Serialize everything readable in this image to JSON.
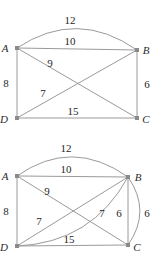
{
  "document": {
    "title": "Weighted quadrilateral graph diagrams",
    "background_color": "#ffffff",
    "edge_color": "#9a9a9a",
    "label_color": "#1f1f1f",
    "vertex_color": "#8a8a8a"
  },
  "figures": [
    {
      "id": "figure-top",
      "vertices": [
        {
          "name": "A",
          "label": "A",
          "x": 17,
          "y": 48,
          "label_x": 5,
          "label_y": 52
        },
        {
          "name": "B",
          "label": "B",
          "x": 137,
          "y": 50,
          "label_x": 146,
          "label_y": 54
        },
        {
          "name": "C",
          "label": "C",
          "x": 137,
          "y": 118,
          "label_x": 146,
          "label_y": 123
        },
        {
          "name": "D",
          "label": "D",
          "x": 17,
          "y": 118,
          "label_x": 4,
          "label_y": 123
        }
      ],
      "edges": [
        {
          "name": "edge-AB-arc",
          "from": "A",
          "to": "B",
          "shape": "arc",
          "weight": "12",
          "label_x": 70,
          "label_y": 24
        },
        {
          "name": "edge-AB",
          "from": "A",
          "to": "B",
          "shape": "line",
          "weight": "10",
          "label_x": 70,
          "label_y": 45
        },
        {
          "name": "edge-AD",
          "from": "A",
          "to": "D",
          "shape": "line",
          "weight": "8",
          "label_x": 4,
          "label_y": 87
        },
        {
          "name": "edge-BC",
          "from": "B",
          "to": "C",
          "shape": "line",
          "weight": "6",
          "label_x": 143,
          "label_y": 88
        },
        {
          "name": "edge-DC",
          "from": "D",
          "to": "C",
          "shape": "line",
          "weight": "15",
          "label_x": 70,
          "label_y": 115
        },
        {
          "name": "edge-AC-diagonal",
          "from": "A",
          "to": "C",
          "shape": "line",
          "weight": "9",
          "label_x": 48,
          "label_y": 67
        },
        {
          "name": "edge-DB-diagonal",
          "from": "D",
          "to": "B",
          "shape": "line",
          "weight": "7",
          "label_x": 40,
          "label_y": 97
        }
      ]
    },
    {
      "id": "figure-bottom",
      "vertices": [
        {
          "name": "A",
          "label": "A",
          "x": 17,
          "y": 45,
          "label_x": 5,
          "label_y": 49
        },
        {
          "name": "B",
          "label": "B",
          "x": 128,
          "y": 46,
          "label_x": 137,
          "label_y": 50
        },
        {
          "name": "C",
          "label": "C",
          "x": 128,
          "y": 114,
          "label_x": 137,
          "label_y": 119
        },
        {
          "name": "D",
          "label": "D",
          "x": 17,
          "y": 115,
          "label_x": 4,
          "label_y": 120
        }
      ],
      "edges": [
        {
          "name": "edge-AB-arc",
          "from": "A",
          "to": "B",
          "shape": "arc",
          "weight": "12",
          "label_x": 66,
          "label_y": 21
        },
        {
          "name": "edge-AB",
          "from": "A",
          "to": "B",
          "shape": "line",
          "weight": "10",
          "label_x": 66,
          "label_y": 42
        },
        {
          "name": "edge-AD",
          "from": "A",
          "to": "D",
          "shape": "line",
          "weight": "8",
          "label_x": 4,
          "label_y": 84
        },
        {
          "name": "edge-BC",
          "from": "B",
          "to": "C",
          "shape": "line",
          "weight": "6",
          "label_x": 114,
          "label_y": 85
        },
        {
          "name": "edge-BC-arc",
          "from": "B",
          "to": "C",
          "shape": "arc",
          "weight": "6",
          "label_x": 146,
          "label_y": 85
        },
        {
          "name": "edge-DC",
          "from": "D",
          "to": "C",
          "shape": "line",
          "weight": "15",
          "label_x": 66,
          "label_y": 112
        },
        {
          "name": "edge-AC-diagonal",
          "from": "A",
          "to": "C",
          "shape": "line",
          "weight": "9",
          "label_x": 45,
          "label_y": 64
        },
        {
          "name": "edge-DB-diagonal",
          "from": "D",
          "to": "B",
          "shape": "line",
          "weight": "7",
          "label_x": 37,
          "label_y": 94
        },
        {
          "name": "edge-DB-arc",
          "from": "D",
          "to": "B",
          "shape": "arc",
          "weight": "7",
          "label_x": 100,
          "label_y": 85
        }
      ]
    }
  ]
}
